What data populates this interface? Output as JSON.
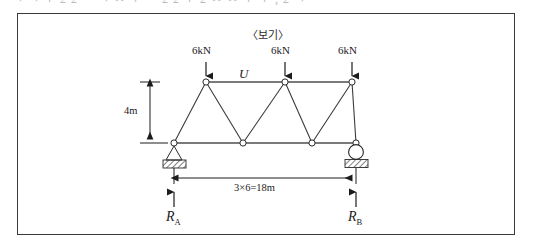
{
  "page": {
    "cropped_top_text": "ㄱ  ㄱ  ㅜ 2 2  ㅡ   ㄱ   ㅅ ㅜ ㅡ 2 2    ㅜ 2    ㅅ  ㅅ ㅜ ㅜ  , 2 ㄱ"
  },
  "figure": {
    "caption": "〈보기〉",
    "type": "warren-truss-free-body-diagram",
    "top_chord_label": "U",
    "loads": [
      {
        "label": "6kN",
        "direction": "down"
      },
      {
        "label": "6kN",
        "direction": "down"
      },
      {
        "label": "6kN",
        "direction": "down"
      }
    ],
    "height_dimension": "4m",
    "span_dimension": "3×6=18m",
    "reactions": [
      {
        "symbol": "R",
        "subscript": "A",
        "direction": "up",
        "support": "pin"
      },
      {
        "symbol": "R",
        "subscript": "B",
        "direction": "up",
        "support": "roller"
      }
    ],
    "supports": {
      "left": "pin-support",
      "right": "roller-support"
    },
    "colors": {
      "line": "#2b2b2b",
      "chord": "#6f6f6f",
      "border": "#3a3a3a",
      "background": "#ffffff",
      "hatch": "#555555"
    }
  },
  "geometry": {
    "top_nodes_x": [
      206,
      285,
      352
    ],
    "top_nodes_y": 82,
    "bottom_nodes_x": [
      174,
      243,
      312,
      355
    ],
    "bottom_nodes_y": 143
  }
}
